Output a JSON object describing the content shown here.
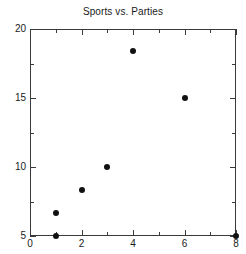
{
  "chart_data": {
    "type": "scatter",
    "title": "Sports vs. Parties",
    "xlabel": "",
    "ylabel": "",
    "xlim": [
      0,
      8
    ],
    "ylim": [
      5,
      20
    ],
    "grid": false,
    "legend": null,
    "marker": {
      "shape": "circle",
      "color": "#111111",
      "size_px": 6
    },
    "x_ticks_major": [
      0,
      2,
      4,
      6,
      8
    ],
    "x_ticks_minor": [
      1,
      3,
      5,
      7
    ],
    "x_tick_labels": [
      "0",
      "2",
      "4",
      "6",
      "8"
    ],
    "y_ticks_major": [
      5,
      10,
      15,
      20
    ],
    "y_ticks_minor": [
      7.5,
      12.5,
      17.5
    ],
    "y_tick_labels": [
      "5",
      "10",
      "15",
      "20"
    ],
    "points": [
      {
        "x": 1,
        "y": 5
      },
      {
        "x": 1,
        "y": 6.7
      },
      {
        "x": 2,
        "y": 8.3
      },
      {
        "x": 3,
        "y": 10
      },
      {
        "x": 4,
        "y": 18.4
      },
      {
        "x": 6,
        "y": 15
      },
      {
        "x": 8,
        "y": 5
      }
    ],
    "x": [
      1,
      1,
      2,
      3,
      4,
      6,
      8
    ],
    "values": [
      5,
      6.7,
      8.3,
      10,
      18.4,
      15,
      5
    ]
  },
  "colors": {
    "background": "#ffffff",
    "axis": "#3a3a3a",
    "text": "#1a1a1a",
    "marker": "#111111"
  }
}
